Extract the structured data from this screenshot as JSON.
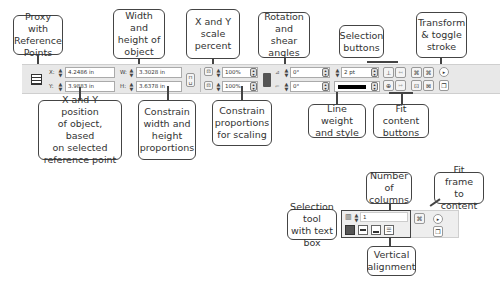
{
  "callouts": {
    "proxy": "Proxy with\nReference\nPoints",
    "width_height": "Width and\nheight of\nobject",
    "scale": "X and Y\nscale\npercent",
    "rotation": "Rotation\nand shear\nangles",
    "selection": "Selection\nbuttons",
    "transform": "Transform\n& toggle\nstroke",
    "xy_position": "X and Y position\nof object, based\non selected\nreference point",
    "constrain_wh": "Constrain\nwidth and\nheight\nproportions",
    "constrain_scale": "Constrain\nproportions\nfor scaling",
    "line_weight": "Line weight\nand style",
    "fit_content": "Fit content\nbuttons",
    "columns": "Number of\ncolumns",
    "fit_frame": "Fit frame\nto content",
    "selection_tool": "Selection tool\nwith text box",
    "vertical_alignment": "Vertical\nalignment"
  },
  "toolbar": {
    "x_label": "X:",
    "x_value": "4.2486 in",
    "y_label": "Y:",
    "y_value": "3.9883 in",
    "w_label": "W:",
    "w_value": "3.3028 in",
    "h_label": "H:",
    "h_value": "3.6378 in",
    "scale_x": "100%",
    "scale_y": "100%",
    "rotation": "0°",
    "shear": "0°",
    "stroke_weight": "2 pt"
  },
  "text_toolbar": {
    "columns": "1"
  }
}
